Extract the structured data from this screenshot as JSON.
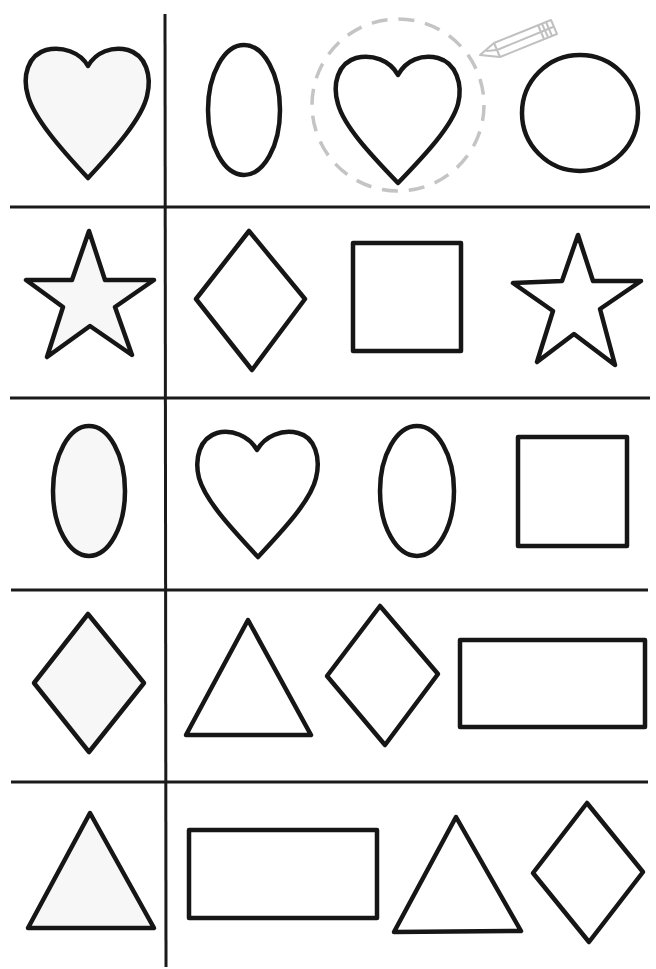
{
  "worksheet": {
    "title": "Find the matching shape",
    "instruction_hint": "dashed-circle-with-pencil",
    "colors": {
      "line": "#161616",
      "sample_fill": "#f7f7f7",
      "hint": "#c4c4c4",
      "background": "#ffffff"
    },
    "rows": [
      {
        "sample": "heart",
        "options": [
          "oval",
          "heart",
          "circle"
        ],
        "circled_option": 1
      },
      {
        "sample": "star",
        "options": [
          "diamond",
          "square",
          "star"
        ],
        "circled_option": null
      },
      {
        "sample": "oval",
        "options": [
          "heart",
          "oval",
          "square"
        ],
        "circled_option": null
      },
      {
        "sample": "diamond",
        "options": [
          "triangle",
          "diamond",
          "rectangle"
        ],
        "circled_option": null
      },
      {
        "sample": "triangle",
        "options": [
          "rectangle",
          "triangle",
          "diamond"
        ],
        "circled_option": null
      }
    ]
  }
}
